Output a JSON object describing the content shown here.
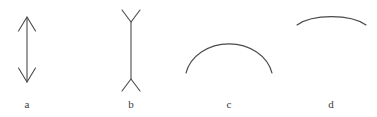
{
  "figure": {
    "width": 377,
    "height": 117,
    "background_color": "#ffffff",
    "stroke_color": "#4a4a4a",
    "stroke_width": 1,
    "label_color": "#3a3a3a",
    "label_font_size": 11,
    "panels": [
      {
        "id": "a",
        "label": "a",
        "shape": "double-headed-vertical-arrow",
        "description": "Vertical line segment with arrowheads pointing outward at both the top and the bottom.",
        "line": {
          "x1": 27,
          "y1": 17,
          "x2": 27,
          "y2": 82
        },
        "arrowheads": [
          {
            "position": "top",
            "direction": "up",
            "apex_x": 27,
            "apex_y": 17,
            "left_x": 18,
            "left_y": 31,
            "right_x": 36,
            "right_y": 31
          },
          {
            "position": "bottom",
            "direction": "down",
            "apex_x": 27,
            "apex_y": 82,
            "left_x": 18,
            "left_y": 68,
            "right_x": 36,
            "right_y": 68
          }
        ],
        "label_position": {
          "x": 27,
          "y": 105
        }
      },
      {
        "id": "b",
        "label": "b",
        "shape": "vertical-line-with-outward-fins",
        "description": "Vertical line segment with V-shaped fins opening away from the line at both ends (Mueller-Lyer fins-out form).",
        "line": {
          "x1": 131,
          "y1": 22,
          "x2": 131,
          "y2": 79
        },
        "fins": [
          {
            "position": "top",
            "direction": "opens-up",
            "vertex_x": 131,
            "vertex_y": 22,
            "left_x": 122,
            "left_y": 10,
            "right_x": 140,
            "right_y": 10
          },
          {
            "position": "bottom",
            "direction": "opens-down",
            "vertex_x": 131,
            "vertex_y": 79,
            "left_x": 122,
            "left_y": 91,
            "right_x": 140,
            "right_y": 91
          }
        ],
        "label_position": {
          "x": 131,
          "y": 105
        }
      },
      {
        "id": "c",
        "label": "c",
        "shape": "arc-convex-up-large",
        "description": "Large arc curving upward, opening downward, like a dome or half circle.",
        "arc": {
          "start_x": 186,
          "start_y": 73,
          "end_x": 272,
          "end_y": 73,
          "apex_x": 229,
          "apex_y": 37,
          "radius_x": 44,
          "radius_y": 37
        },
        "label_position": {
          "x": 229,
          "y": 105
        }
      },
      {
        "id": "d",
        "label": "d",
        "shape": "arc-convex-up-shallow",
        "description": "Shallower, flatter arc curving upward, opening downward, positioned near the top of the panel.",
        "arc": {
          "start_x": 297,
          "start_y": 25,
          "end_x": 366,
          "end_y": 25,
          "apex_x": 331,
          "apex_y": 11,
          "radius_x": 35,
          "radius_y": 15
        },
        "label_position": {
          "x": 331,
          "y": 105
        }
      }
    ]
  }
}
